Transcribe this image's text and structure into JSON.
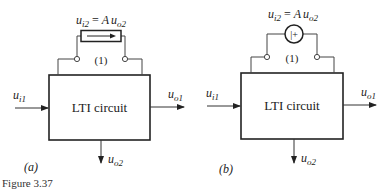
{
  "figure": {
    "caption": "Figure 3.37",
    "panels": [
      {
        "tag": "(a)",
        "box_label": "LTI circuit",
        "port_label": "(1)",
        "source_type": "current-source",
        "source_eq": {
          "u": "u",
          "sub1": "i2",
          "eq": " = ",
          "A": "A",
          "u2": "u",
          "sub2": "o2"
        },
        "input": {
          "u": "u",
          "sub": "i1"
        },
        "output1": {
          "u": "u",
          "sub": "o1"
        },
        "output2": {
          "u": "u",
          "sub": "o2"
        }
      },
      {
        "tag": "(b)",
        "box_label": "LTI circuit",
        "port_label": "(1)",
        "source_type": "voltage-source",
        "source_symbol": "|+",
        "source_eq": {
          "u": "u",
          "sub1": "i2",
          "eq": " = ",
          "A": "A",
          "u2": "u",
          "sub2": "o2"
        },
        "input": {
          "u": "u",
          "sub": "i1"
        },
        "output1": {
          "u": "u",
          "sub": "o1"
        },
        "output2": {
          "u": "u",
          "sub": "o2"
        }
      }
    ]
  },
  "colors": {
    "stroke": "#333333",
    "box": "#222222",
    "text": "#222222"
  }
}
